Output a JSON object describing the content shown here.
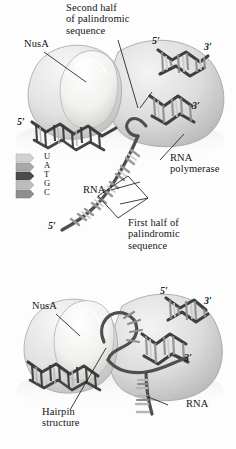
{
  "figure": {
    "type": "biology-illustration",
    "style": "grayscale shaded textbook diagram",
    "background_color": "#fdfdfd",
    "panel_count": 2
  },
  "legend": {
    "name": "nucleotide-key",
    "letters": [
      "U",
      "A",
      "T",
      "G",
      "C"
    ],
    "swatch_colors": [
      "#d2d2d2",
      "#a8a8a8",
      "#4b4b4b",
      "#bdbdbd",
      "#8f8f8f"
    ]
  },
  "panel_top": {
    "labels": {
      "title": "Second half\nof palindromic\nsequence",
      "nusa": "NusA",
      "rna_polymerase": "RNA\npolymerase",
      "first_half": "First half of\npalindromic\nsequence",
      "rna": "RNA",
      "prime_5_dna_right": "5′",
      "prime_3_dna_right": "3′",
      "prime_3_template": "3′",
      "prime_5_dna_left": "5′",
      "prime_5_rna": "5′"
    }
  },
  "panel_bottom": {
    "labels": {
      "nusa": "NusA",
      "hairpin": "Hairpin\nstructure",
      "rna": "RNA",
      "prime_5_dna_right": "5′",
      "prime_3_dna_right": "3′",
      "prime_3_template": "3′"
    }
  },
  "colors": {
    "protein_light": "#efefef",
    "protein_mid": "#d8d8d8",
    "protein_shadow": "#b4b4b4",
    "dna_strand": "#4a4a4a",
    "rna_strand": "#555555",
    "base_dark": "#3a3a3a",
    "base_mid": "#8d8d8d",
    "base_light": "#c9c9c9",
    "leader_line": "#1d1d1d",
    "text": "#15161a"
  }
}
